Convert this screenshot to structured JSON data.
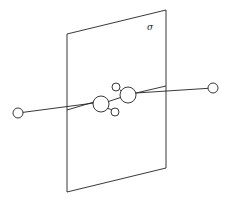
{
  "diagram": {
    "plane_label": "σ",
    "atoms": [
      {
        "name": "left-terminal-atom",
        "size": "small"
      },
      {
        "name": "central-atom-left",
        "size": "large"
      },
      {
        "name": "central-atom-right",
        "size": "large"
      },
      {
        "name": "upper-substituent-atom",
        "size": "small"
      },
      {
        "name": "lower-substituent-atom",
        "size": "small"
      },
      {
        "name": "right-terminal-atom",
        "size": "small"
      }
    ],
    "colors": {
      "stroke": "#222222",
      "background": "#ffffff"
    }
  }
}
